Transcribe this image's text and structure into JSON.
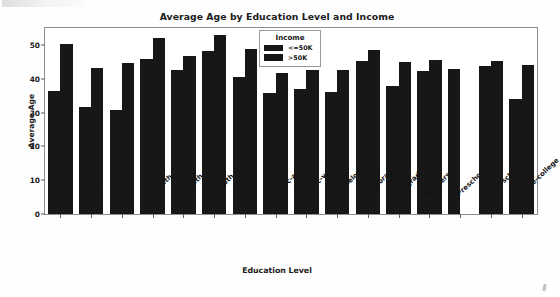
{
  "chart_data": {
    "type": "bar",
    "title": "Average Age by Education Level and Income",
    "xlabel": "Education Level",
    "ylabel": "Average Age",
    "grid": false,
    "legend_title": "Income",
    "legend_position": "upper center",
    "ylim": [
      0,
      55
    ],
    "yticks": [
      0,
      10,
      20,
      30,
      40,
      50
    ],
    "categories": [
      "10th",
      "11th",
      "12th",
      "1st-4th",
      "5th-6th",
      "7th-8th",
      "9th",
      "Assoc-acdm",
      "Assoc-voc",
      "Bachelors",
      "Doctorate",
      "HS-grad",
      "Masters",
      "Preschool",
      "Prof-school",
      "Some-college"
    ],
    "series": [
      {
        "name": "<=50K",
        "values": [
          36.3,
          31.6,
          30.9,
          45.8,
          42.7,
          48.2,
          40.5,
          35.9,
          37.1,
          36.2,
          45.1,
          37.8,
          42.3,
          42.9,
          43.7,
          33.9
        ]
      },
      {
        "name": ">50K",
        "values": [
          50.3,
          43.2,
          44.6,
          52.0,
          46.8,
          52.8,
          48.9,
          41.7,
          42.5,
          42.7,
          48.6,
          45.0,
          45.4,
          null,
          45.1,
          44.2
        ]
      }
    ]
  },
  "colors": {
    "bar": "#171717",
    "axis": "#8d8d8d",
    "text": "#1b1b1b",
    "background": "#ffffff"
  }
}
